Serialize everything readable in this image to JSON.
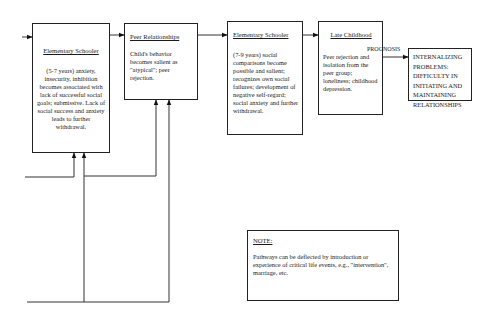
{
  "boxes": {
    "elementary_5_7": {
      "title": "Elementary Schooler",
      "body": "(5-7 years) anxiety, insecurity, inhibition becomes associated with lack of successful social goals; submissive.  Lack of social success and anxiety leads to further withdrawal."
    },
    "peer_relationships": {
      "title": "Peer Relationships",
      "body": "Child's behavior becomes salient as \"atypical\"; peer rejection."
    },
    "elementary_7_9": {
      "title": "Elementary Schooler",
      "body": "(7-9 years) social comparisons become possible and salient; recognizes own social failures; development of negative self-regard; social anxiety and further withdrawal."
    },
    "late_childhood": {
      "title": "Late Childhood",
      "body": "Peer rejection and isolation from the peer group; loneliness; childhood depression."
    },
    "outcome": {
      "body": "INTERNALIZING PROBLEMS: DIFFICULTY IN INITIATING AND MAINTAINING RELATIONSHIPS"
    }
  },
  "arrow_labels": {
    "prognosis": "PROGNOSIS"
  },
  "note": {
    "title": "NOTE:",
    "body": "Pathways can be deflected by introduction or experience of critical life events, e.g., \"intervention\", marriage, etc."
  }
}
